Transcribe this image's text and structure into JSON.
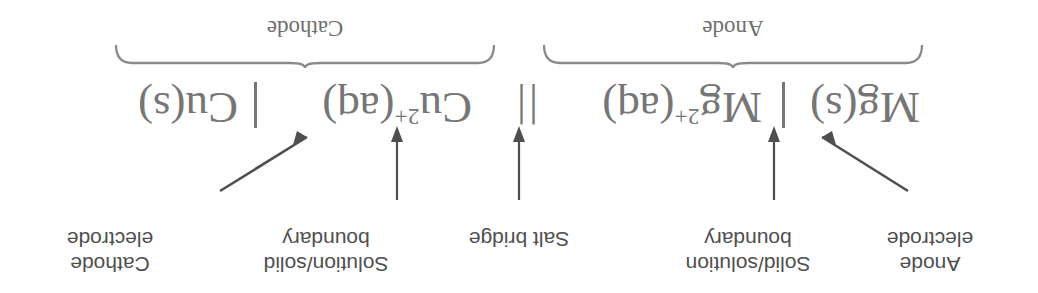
{
  "figure": {
    "orientation": "rotated-180",
    "colors": {
      "label_text": "#4f4f4f",
      "notation_text": "#767676",
      "arrow": "#4f4f4f",
      "brace": "#8a8a8a",
      "background": "#ffffff"
    }
  },
  "annotations": {
    "cathode_electrode": "Cathode\nelectrode",
    "solution_solid_boundary": "Solution/solid\nboundary",
    "salt_bridge": "Salt bridge",
    "solid_solution_boundary": "Solid/solution\nboundary",
    "anode_electrode": "Anode\nelectrode"
  },
  "notation": {
    "left_half": {
      "electrode_species": "Cu(s)",
      "separator": "|",
      "ion_species": "Cu",
      "ion_charge": "2+",
      "ion_state": "(aq)",
      "full": "Cu(s) | Cu2+(aq)"
    },
    "salt_bridge_symbol": "||",
    "right_half": {
      "ion_species": "Mg",
      "ion_charge": "2+",
      "ion_state": "(aq)",
      "separator": "|",
      "electrode_species": "Mg(s)",
      "full": "Mg2+(aq) | Mg(s)"
    }
  },
  "braces": {
    "left_label": "Cathode",
    "right_label": "Anode"
  }
}
